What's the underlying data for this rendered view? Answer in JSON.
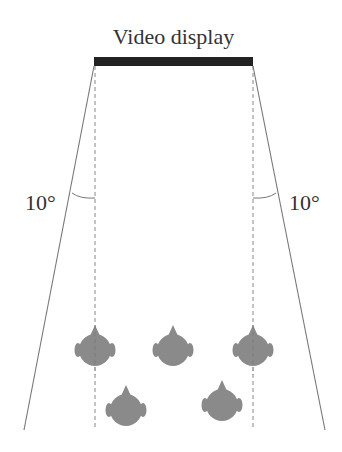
{
  "diagram": {
    "title": "Video display",
    "angle_left": "10°",
    "angle_right": "10°",
    "display_bar": {
      "x1": 94,
      "x2": 253,
      "y": 57,
      "height": 9,
      "color": "#222222"
    },
    "viewing_boundaries": {
      "left": {
        "from": [
          94,
          66
        ],
        "to": [
          24,
          430
        ]
      },
      "right": {
        "from": [
          253,
          66
        ],
        "to": [
          325,
          430
        ]
      }
    },
    "reference_lines": {
      "style": "dashed",
      "left_x": 95,
      "right_x": 253,
      "y_from": 66,
      "y_to": 430
    },
    "viewers": [
      {
        "label": "viewer-1",
        "row": "front",
        "cx": 95,
        "cy": 350
      },
      {
        "label": "viewer-2",
        "row": "front",
        "cx": 173,
        "cy": 350
      },
      {
        "label": "viewer-3",
        "row": "front",
        "cx": 253,
        "cy": 350
      },
      {
        "label": "viewer-4",
        "row": "back",
        "cx": 126,
        "cy": 410
      },
      {
        "label": "viewer-5",
        "row": "back",
        "cx": 222,
        "cy": 405
      }
    ],
    "colors": {
      "head_fill": "#8a8a8a",
      "line": "#777777",
      "text": "#333333"
    }
  }
}
